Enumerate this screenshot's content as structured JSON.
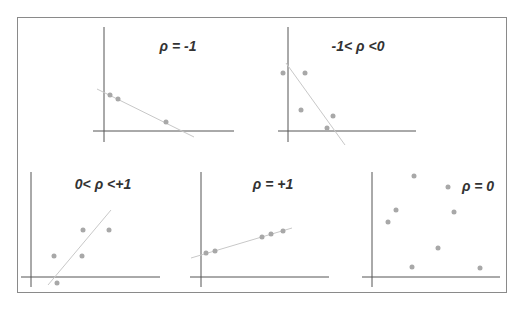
{
  "figure": {
    "panels": [
      {
        "id": "p1",
        "title": "ρ = -1",
        "title_pos": [
          178,
          51
        ],
        "y_axis": {
          "x": 104,
          "y1": 27,
          "y2": 142
        },
        "x_axis": {
          "y": 131,
          "x1": 93,
          "x2": 234
        },
        "fit_line": [
          97,
          89,
          194,
          137
        ],
        "points": [
          [
            110,
            95
          ],
          [
            118,
            99
          ],
          [
            166,
            122
          ]
        ]
      },
      {
        "id": "p2",
        "title": "-1< ρ <0",
        "title_pos": [
          358,
          51
        ],
        "y_axis": {
          "x": 288,
          "y1": 27,
          "y2": 142
        },
        "x_axis": {
          "y": 131,
          "x1": 278,
          "x2": 416
        },
        "fit_line": [
          286,
          63,
          345,
          145
        ],
        "points": [
          [
            283,
            73
          ],
          [
            305,
            73
          ],
          [
            301,
            110
          ],
          [
            333,
            116
          ],
          [
            327,
            128
          ]
        ]
      },
      {
        "id": "p3",
        "title": "0< ρ <+1",
        "title_pos": [
          103,
          189
        ],
        "y_axis": {
          "x": 31,
          "y1": 172,
          "y2": 287
        },
        "x_axis": {
          "y": 277,
          "x1": 21,
          "x2": 160
        },
        "fit_line": [
          48,
          285,
          111,
          210
        ],
        "points": [
          [
            54,
            256
          ],
          [
            83,
            230
          ],
          [
            109,
            230
          ],
          [
            82,
            256
          ],
          [
            57,
            283
          ]
        ]
      },
      {
        "id": "p4",
        "title": "ρ = +1",
        "title_pos": [
          273,
          189
        ],
        "y_axis": {
          "x": 201,
          "y1": 172,
          "y2": 287
        },
        "x_axis": {
          "y": 277,
          "x1": 190,
          "x2": 329
        },
        "fit_line": [
          191,
          258,
          292,
          228
        ],
        "points": [
          [
            206,
            253
          ],
          [
            215,
            251
          ],
          [
            262,
            237
          ],
          [
            271,
            234
          ],
          [
            283,
            231
          ]
        ]
      },
      {
        "id": "p5",
        "title": "ρ = 0",
        "title_pos": [
          478,
          191
        ],
        "y_axis": {
          "x": 372,
          "y1": 172,
          "y2": 287
        },
        "x_axis": {
          "y": 277,
          "x1": 362,
          "x2": 500
        },
        "fit_line": null,
        "points": [
          [
            414,
            176
          ],
          [
            448,
            187
          ],
          [
            396,
            210
          ],
          [
            388,
            222
          ],
          [
            454,
            212
          ],
          [
            438,
            248
          ],
          [
            412,
            267
          ],
          [
            480,
            268
          ]
        ]
      }
    ],
    "colors": {
      "axis": "#555555",
      "fit_line": "#c8c8c8",
      "point": "#a8a8a8",
      "title": "#333333",
      "frame": "#8a8a8a"
    }
  }
}
